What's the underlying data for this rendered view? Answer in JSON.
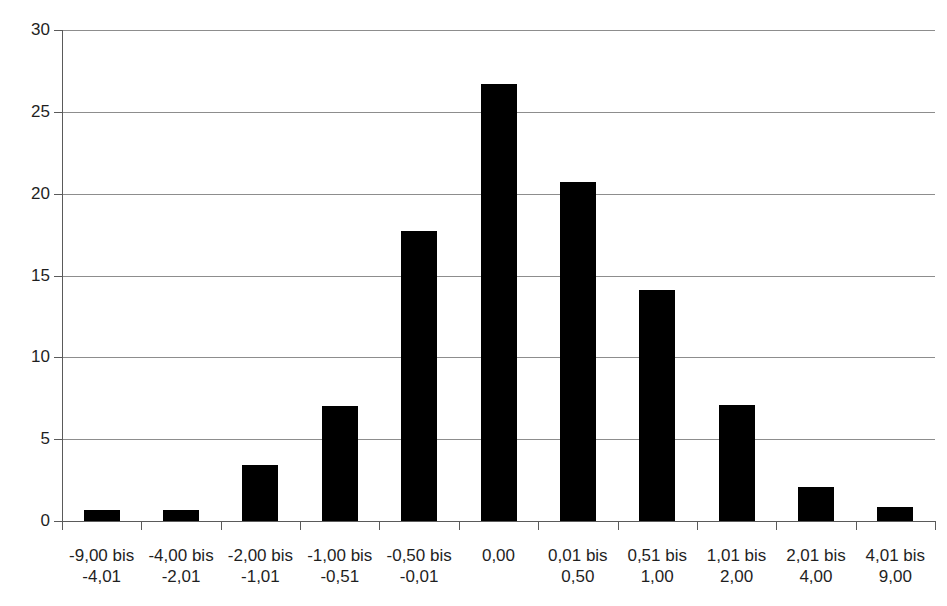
{
  "chart_data": {
    "type": "bar",
    "title": "",
    "xlabel": "",
    "ylabel": "",
    "ylim": [
      0,
      30
    ],
    "yticks": [
      0,
      5,
      10,
      15,
      20,
      25,
      30
    ],
    "ytick_labels": [
      "0",
      "5",
      "10",
      "15",
      "20",
      "25",
      "30"
    ],
    "grid": true,
    "legend": "none",
    "bar_color": "#000000",
    "gridline_color": "#8d8d8d",
    "axis_color": "#5a5a5a",
    "categories": [
      "-9,00 bis\n-4,01",
      "-4,00 bis\n-2,01",
      "-2,00 bis\n-1,01",
      "-1,00 bis\n-0,51",
      "-0,50 bis\n-0,01",
      "0,00",
      "0,01 bis\n0,50",
      "0,51 bis\n1,00",
      "1,01 bis\n2,00",
      "2,01 bis\n4,00",
      "4,01 bis\n9,00"
    ],
    "values": [
      0.65,
      0.7,
      3.4,
      7.0,
      17.7,
      26.7,
      20.7,
      14.1,
      7.1,
      2.1,
      0.85
    ]
  },
  "axis": {
    "y_labels": [
      "30",
      "25",
      "20",
      "15",
      "10",
      "5",
      "0"
    ]
  }
}
